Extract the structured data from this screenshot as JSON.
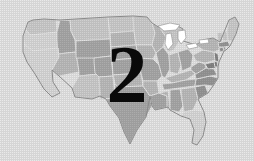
{
  "figure": {
    "kind": "thematic-map",
    "region": "Contiguous United States",
    "overlay_label": "2",
    "background_color": "#ffffff",
    "outline_color": "#8a8a8a",
    "border_color": "#ffffff",
    "overlay_color": "#0a0a0a",
    "fill_palette": {
      "very_light": "#f2f2f2",
      "light": "#e4e4e4",
      "medium_light": "#d2d2d2",
      "medium": "#bdbdbd",
      "medium_dark": "#a9a9a9",
      "dark": "#949494"
    }
  },
  "map_regions": [
    {
      "name": "Washington",
      "tone": "light"
    },
    {
      "name": "Oregon",
      "tone": "very_light"
    },
    {
      "name": "California",
      "tone": "very_light"
    },
    {
      "name": "Idaho",
      "tone": "medium"
    },
    {
      "name": "Nevada",
      "tone": "medium_light"
    },
    {
      "name": "Utah",
      "tone": "medium"
    },
    {
      "name": "Arizona",
      "tone": "light"
    },
    {
      "name": "Montana",
      "tone": "light"
    },
    {
      "name": "Wyoming",
      "tone": "medium"
    },
    {
      "name": "Colorado",
      "tone": "medium"
    },
    {
      "name": "New Mexico",
      "tone": "medium_light"
    },
    {
      "name": "North Dakota",
      "tone": "light"
    },
    {
      "name": "South Dakota",
      "tone": "medium_light"
    },
    {
      "name": "Nebraska",
      "tone": "medium"
    },
    {
      "name": "Kansas",
      "tone": "medium"
    },
    {
      "name": "Oklahoma",
      "tone": "medium_light"
    },
    {
      "name": "Texas",
      "tone": "medium"
    },
    {
      "name": "Minnesota",
      "tone": "light"
    },
    {
      "name": "Iowa",
      "tone": "medium_light"
    },
    {
      "name": "Missouri",
      "tone": "medium"
    },
    {
      "name": "Arkansas",
      "tone": "medium_light"
    },
    {
      "name": "Louisiana",
      "tone": "medium"
    },
    {
      "name": "Wisconsin",
      "tone": "medium_light"
    },
    {
      "name": "Illinois",
      "tone": "medium"
    },
    {
      "name": "Michigan",
      "tone": "light"
    },
    {
      "name": "Indiana",
      "tone": "medium_light"
    },
    {
      "name": "Ohio",
      "tone": "medium"
    },
    {
      "name": "Kentucky",
      "tone": "medium_light"
    },
    {
      "name": "Tennessee",
      "tone": "medium"
    },
    {
      "name": "Mississippi",
      "tone": "medium_light"
    },
    {
      "name": "Alabama",
      "tone": "medium"
    },
    {
      "name": "Georgia",
      "tone": "medium_light"
    },
    {
      "name": "Florida",
      "tone": "very_light"
    },
    {
      "name": "South Carolina",
      "tone": "medium_dark"
    },
    {
      "name": "North Carolina",
      "tone": "medium_dark"
    },
    {
      "name": "Virginia",
      "tone": "medium_dark"
    },
    {
      "name": "West Virginia",
      "tone": "medium"
    },
    {
      "name": "Maryland",
      "tone": "dark"
    },
    {
      "name": "Delaware",
      "tone": "dark"
    },
    {
      "name": "Pennsylvania",
      "tone": "medium_light"
    },
    {
      "name": "New Jersey",
      "tone": "dark"
    },
    {
      "name": "New York",
      "tone": "medium_light"
    },
    {
      "name": "Connecticut",
      "tone": "medium_dark"
    },
    {
      "name": "Rhode Island",
      "tone": "medium_dark"
    },
    {
      "name": "Massachusetts",
      "tone": "medium_dark"
    },
    {
      "name": "Vermont",
      "tone": "light"
    },
    {
      "name": "New Hampshire",
      "tone": "light"
    },
    {
      "name": "Maine",
      "tone": "light"
    }
  ]
}
